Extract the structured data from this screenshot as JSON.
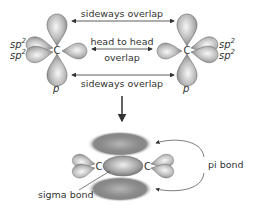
{
  "labels": {
    "top_arrow": "sideways overlap",
    "middle_arrow_line1": "head to head",
    "middle_arrow_line2": "overlap",
    "bottom_arrow": "sideways overlap",
    "carbon": "C",
    "sp2": "sp",
    "sp2_sup": "2",
    "p_orbital": "p",
    "pi_bond": "pi bond",
    "sigma_bond": "sigma bond"
  },
  "colors": {
    "lobe_light": "#f2f2f2",
    "lobe_dark": "#8a8a8a",
    "stroke": "#555555",
    "text": "#333333",
    "arrow": "#333333"
  }
}
